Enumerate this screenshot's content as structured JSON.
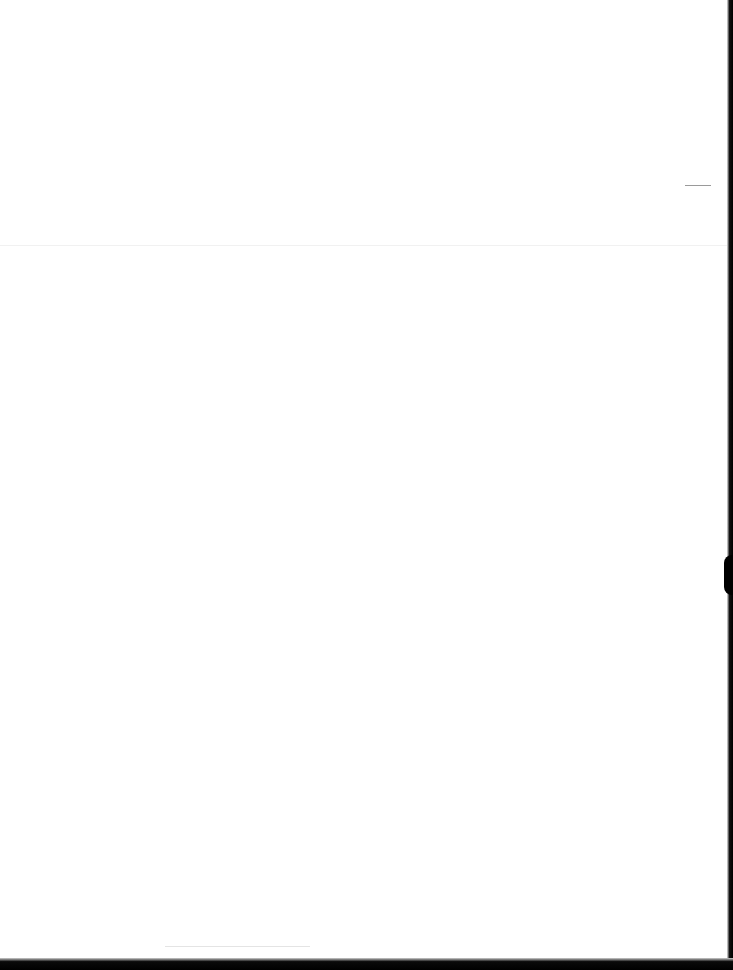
{
  "page": {
    "type": "scanned-blank-page",
    "text": "",
    "colors": {
      "paper": "#ffffff",
      "border": "#000000",
      "fold_line": "#f1f1f1",
      "mark": "#9a9a9a"
    }
  }
}
